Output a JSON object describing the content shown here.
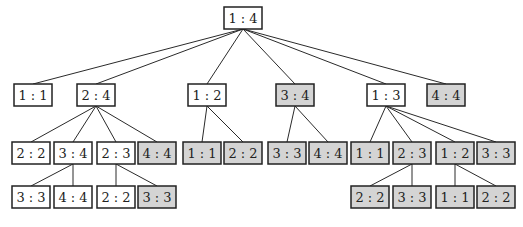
{
  "diagram": {
    "type": "tree",
    "colors": {
      "plain_fill": "#ffffff",
      "shaded_fill": "#d4d4d4",
      "stroke": "#222222"
    },
    "nodes": [
      {
        "id": "n0",
        "label": "1 : 4",
        "level": 0,
        "shaded": false,
        "x": 224,
        "y": 7
      },
      {
        "id": "n1",
        "label": "1 : 1",
        "level": 1,
        "shaded": false,
        "x": 14,
        "y": 84,
        "parent": "n0"
      },
      {
        "id": "n2",
        "label": "2 : 4",
        "level": 1,
        "shaded": false,
        "x": 77,
        "y": 84,
        "parent": "n0"
      },
      {
        "id": "n3",
        "label": "1 : 2",
        "level": 1,
        "shaded": false,
        "x": 188,
        "y": 84,
        "parent": "n0"
      },
      {
        "id": "n4",
        "label": "3 : 4",
        "level": 1,
        "shaded": true,
        "x": 276,
        "y": 84,
        "parent": "n0"
      },
      {
        "id": "n5",
        "label": "1 : 3",
        "level": 1,
        "shaded": false,
        "x": 367,
        "y": 84,
        "parent": "n0"
      },
      {
        "id": "n6",
        "label": "4 : 4",
        "level": 1,
        "shaded": true,
        "x": 427,
        "y": 84,
        "parent": "n0"
      },
      {
        "id": "n7",
        "label": "2 : 2",
        "level": 2,
        "shaded": false,
        "x": 12,
        "y": 142,
        "parent": "n2"
      },
      {
        "id": "n8",
        "label": "3 : 4",
        "level": 2,
        "shaded": false,
        "x": 54,
        "y": 142,
        "parent": "n2"
      },
      {
        "id": "n9",
        "label": "2 : 3",
        "level": 2,
        "shaded": false,
        "x": 97,
        "y": 142,
        "parent": "n2"
      },
      {
        "id": "n10",
        "label": "4 : 4",
        "level": 2,
        "shaded": true,
        "x": 138,
        "y": 142,
        "parent": "n2"
      },
      {
        "id": "n11",
        "label": "1 : 1",
        "level": 2,
        "shaded": true,
        "x": 183,
        "y": 142,
        "parent": "n3"
      },
      {
        "id": "n12",
        "label": "2 : 2",
        "level": 2,
        "shaded": true,
        "x": 224,
        "y": 142,
        "parent": "n3"
      },
      {
        "id": "n13",
        "label": "3 : 3",
        "level": 2,
        "shaded": true,
        "x": 268,
        "y": 142,
        "parent": "n4"
      },
      {
        "id": "n14",
        "label": "4 : 4",
        "level": 2,
        "shaded": true,
        "x": 309,
        "y": 142,
        "parent": "n4"
      },
      {
        "id": "n15",
        "label": "1 : 1",
        "level": 2,
        "shaded": true,
        "x": 351,
        "y": 142,
        "parent": "n5"
      },
      {
        "id": "n16",
        "label": "2 : 3",
        "level": 2,
        "shaded": true,
        "x": 393,
        "y": 142,
        "parent": "n5"
      },
      {
        "id": "n17",
        "label": "1 : 2",
        "level": 2,
        "shaded": true,
        "x": 436,
        "y": 142,
        "parent": "n5"
      },
      {
        "id": "n18",
        "label": "3 : 3",
        "level": 2,
        "shaded": true,
        "x": 477,
        "y": 142,
        "parent": "n5"
      },
      {
        "id": "n19",
        "label": "3 : 3",
        "level": 3,
        "shaded": false,
        "x": 12,
        "y": 186,
        "parent": "n8"
      },
      {
        "id": "n20",
        "label": "4 : 4",
        "level": 3,
        "shaded": false,
        "x": 54,
        "y": 186,
        "parent": "n8"
      },
      {
        "id": "n21",
        "label": "2 : 2",
        "level": 3,
        "shaded": false,
        "x": 97,
        "y": 186,
        "parent": "n9"
      },
      {
        "id": "n22",
        "label": "3 : 3",
        "level": 3,
        "shaded": true,
        "x": 138,
        "y": 186,
        "parent": "n9"
      },
      {
        "id": "n23",
        "label": "2 : 2",
        "level": 3,
        "shaded": true,
        "x": 351,
        "y": 186,
        "parent": "n16"
      },
      {
        "id": "n24",
        "label": "3 : 3",
        "level": 3,
        "shaded": true,
        "x": 393,
        "y": 186,
        "parent": "n16"
      },
      {
        "id": "n25",
        "label": "1 : 1",
        "level": 3,
        "shaded": true,
        "x": 436,
        "y": 186,
        "parent": "n17"
      },
      {
        "id": "n26",
        "label": "2 : 2",
        "level": 3,
        "shaded": true,
        "x": 477,
        "y": 186,
        "parent": "n17"
      }
    ]
  }
}
